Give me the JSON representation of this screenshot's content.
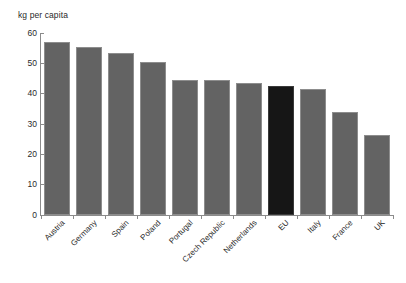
{
  "chart_data": {
    "type": "bar",
    "title": "",
    "subtitle": "",
    "xlabel": "",
    "ylabel": "kg per capita",
    "ylim": [
      0,
      60
    ],
    "yticks": [
      0,
      10,
      20,
      30,
      40,
      50,
      60
    ],
    "ytick_labels": [
      "0",
      "10",
      "20",
      "30",
      "40",
      "50",
      "60"
    ],
    "grid": false,
    "legend": "none",
    "categories": [
      "Austria",
      "Germany",
      "Spain",
      "Poland",
      "Portugal",
      "Czech Republic",
      "Netherlands",
      "EU",
      "Italy",
      "France",
      "UK"
    ],
    "values": [
      57,
      55.5,
      53.5,
      50.5,
      44.5,
      44.5,
      43.5,
      42.5,
      41.5,
      34,
      26.5
    ],
    "highlight_category": "EU",
    "colors": {
      "bar": "#636363",
      "bar_highlight": "#161616",
      "axis": "#8b8b8b",
      "text": "#2a2a2a",
      "background": "#ffffff"
    }
  }
}
